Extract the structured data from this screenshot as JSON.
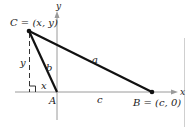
{
  "diagram": {
    "type": "triangle-on-coordinate-axes",
    "axes": {
      "x_label": "x",
      "y_label": "y"
    },
    "points": {
      "C": {
        "label": "C = (x, y)"
      },
      "A": {
        "label": "A"
      },
      "B": {
        "label": "B = (c, 0)"
      }
    },
    "sides": {
      "a": "a",
      "b": "b",
      "c": "c"
    },
    "height_label": "y",
    "foot_label": "x",
    "colors": {
      "triangle": "#111111",
      "axes": "#9a9a9a",
      "dashed": "#333333",
      "border": "#cfcfcf"
    }
  }
}
